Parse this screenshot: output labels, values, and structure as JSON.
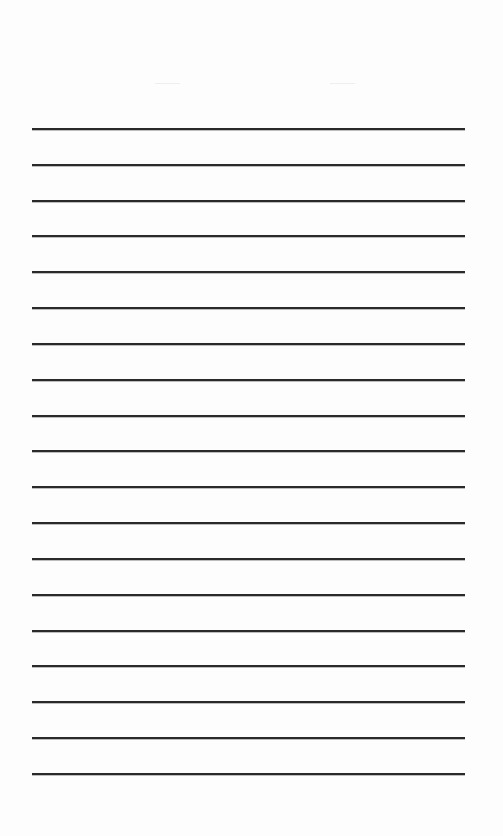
{
  "page": {
    "type": "lined-paper",
    "background": "#fdfdfd",
    "line_color": "#2a2a2a",
    "line_count": 19,
    "line_left": 32,
    "line_width": 433,
    "first_line_y": 128,
    "line_spacing": 35.83
  }
}
